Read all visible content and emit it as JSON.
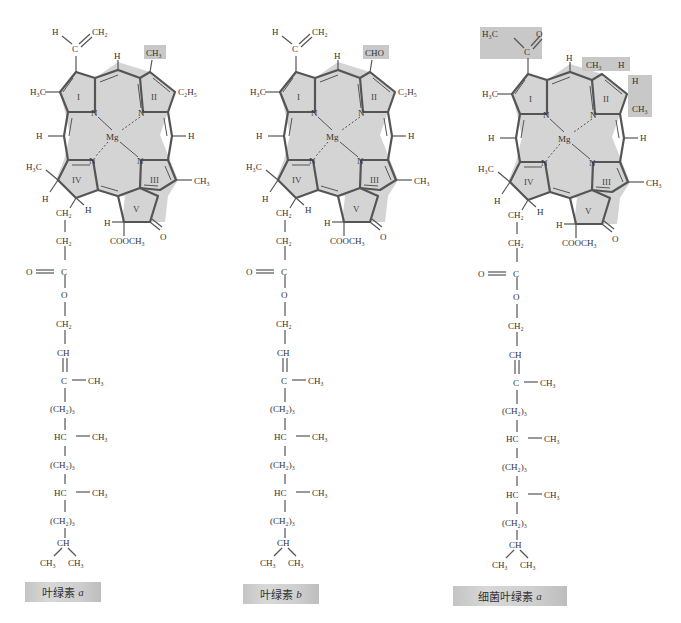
{
  "figure": {
    "structures": [
      {
        "id": "chl-a",
        "caption_text": "叶绿素",
        "caption_italic": "a",
        "highlight_group": "CH₃",
        "position2_group": "CH3"
      },
      {
        "id": "chl-b",
        "caption_text": "叶绿素",
        "caption_italic": "b",
        "highlight_group": "CHO",
        "position2_group": "CHO"
      },
      {
        "id": "bchl-a",
        "caption_text": "细菌叶绿素",
        "caption_italic": "a",
        "highlight_group": "acetyl + reduced ring II",
        "position2_group": "CH3 / H (ring II saturated)"
      }
    ],
    "labels": {
      "mg": "Mg",
      "n": "N",
      "h": "H",
      "vinyl_c": "C",
      "ch2": "CH₂",
      "ch3": "CH₃",
      "h3c": "H₃C",
      "c2h5": "C₂H₅",
      "cho": "CHO",
      "cooch3": "COOCH₃",
      "o": "O",
      "ring_I": "I",
      "ring_II": "II",
      "ring_III": "III",
      "ring_IV": "IV",
      "ring_V": "V"
    },
    "phytyl_chain": [
      "CH₂",
      "CH₂",
      "C",
      "O",
      "CH₂",
      "CH",
      "C",
      "(CH₂)₃",
      "HC",
      "(CH₂)₃",
      "HC",
      "(CH₂)₃",
      "CH",
      "CH₃",
      "CH₃"
    ],
    "colors": {
      "ring_fill": "#d4d4d4",
      "bond": "#555555",
      "highlight": "#c8c8c8"
    }
  }
}
